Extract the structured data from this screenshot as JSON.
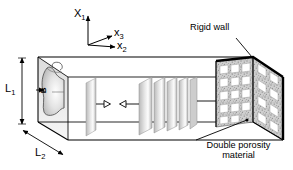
{
  "figure": {
    "type": "technical-diagram",
    "background_color": "#ffffff",
    "line_color": "#000000"
  },
  "axes": {
    "name": "coordinate-triad",
    "origin": {
      "x": 88,
      "y": 45
    },
    "vertical": {
      "label": "X",
      "subscript": "1",
      "direction": "up"
    },
    "horizontal": {
      "label": "x",
      "subscript": "3",
      "direction": "right"
    },
    "diagonal": {
      "label": "x",
      "subscript": "2",
      "direction": "down-right"
    }
  },
  "dimensions": [
    {
      "name": "height",
      "label": "L",
      "subscript": "1",
      "orientation": "vertical"
    },
    {
      "name": "depth",
      "label": "L",
      "subscript": "2",
      "orientation": "diagonal"
    },
    {
      "name": "source-width",
      "label": "B",
      "orientation": "rotated"
    }
  ],
  "annotations": [
    {
      "name": "rigid-wall",
      "text": "Rigid wall",
      "lines": [
        "Rigid wall"
      ],
      "position": "top-right"
    },
    {
      "name": "double-porosity-material",
      "text": "Double porosity material",
      "lines": [
        "Double porosity",
        "material"
      ],
      "position": "bottom-right"
    }
  ],
  "elements": {
    "duct": "rectangular waveguide in perspective",
    "source": "curved acoustic source on left face",
    "wavefronts": "stack of gray planes inside duct",
    "flow_arrows": "opposing triangular arrowheads",
    "porous_block": {
      "texture": "speckled",
      "hole_columns": 4,
      "hole_rows": 5,
      "hole_color": "#ffffff"
    }
  },
  "colors": {
    "stroke": "#000000",
    "plane_light": "#f2f2f2",
    "plane_mid": "#c9c9c9",
    "plane_dark": "#9a9a9a",
    "porous_base": "#c6c6c6"
  }
}
